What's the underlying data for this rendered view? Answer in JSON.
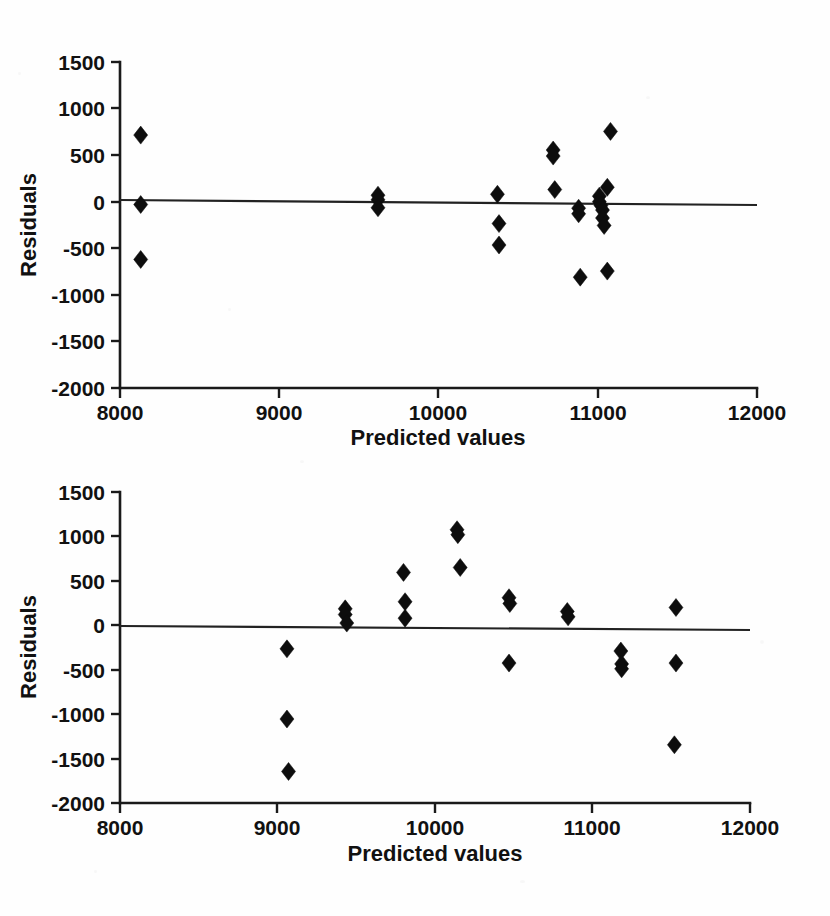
{
  "figure": {
    "background_color": "#fefefe",
    "ink_color": "#0d0d0d",
    "panel_count": 2
  },
  "panels": [
    {
      "id": "top",
      "name": "residual-plot-top",
      "ylabel": "Residuals",
      "xlabel": "Predicted values",
      "x_ticks": [
        "8000",
        "9000",
        "10000",
        "11000",
        "12000"
      ],
      "y_ticks": [
        "1500",
        "1000",
        "500",
        "0",
        "-500",
        "-1000",
        "-1500",
        "-2000"
      ]
    },
    {
      "id": "bottom",
      "name": "residual-plot-bottom",
      "ylabel": "Residuals",
      "xlabel": "Predicted values",
      "x_ticks": [
        "8000",
        "9000",
        "10000",
        "11000",
        "12000"
      ],
      "y_ticks": [
        "1500",
        "1000",
        "500",
        "0",
        "-500",
        "-1000",
        "-1500",
        "-2000"
      ]
    }
  ],
  "chart_data": [
    {
      "type": "scatter",
      "title": "",
      "subtitle": "",
      "xlabel": "Predicted values",
      "ylabel": "Residuals",
      "xlim": [
        8000,
        12000
      ],
      "ylim": [
        -2000,
        1500
      ],
      "xticks": [
        8000,
        9000,
        10000,
        11000,
        12000
      ],
      "yticks": [
        1500,
        1000,
        500,
        0,
        -500,
        -1000,
        -1500,
        -2000
      ],
      "grid": false,
      "legend": null,
      "reference_line": {
        "y": 0,
        "style": "solid"
      },
      "marker": "diamond",
      "series": [
        {
          "name": "residuals",
          "points": [
            [
              8130,
              715
            ],
            [
              8130,
              -30
            ],
            [
              8130,
              -620
            ],
            [
              9620,
              70
            ],
            [
              9620,
              20
            ],
            [
              9620,
              -65
            ],
            [
              10370,
              80
            ],
            [
              10380,
              -235
            ],
            [
              10380,
              -465
            ],
            [
              10720,
              555
            ],
            [
              10720,
              490
            ],
            [
              10730,
              130
            ],
            [
              10880,
              -70
            ],
            [
              10880,
              -130
            ],
            [
              10890,
              -810
            ],
            [
              11010,
              60
            ],
            [
              11010,
              0
            ],
            [
              11020,
              -40
            ],
            [
              11030,
              -90
            ],
            [
              11030,
              -175
            ],
            [
              11040,
              -255
            ],
            [
              11060,
              155
            ],
            [
              11060,
              -745
            ],
            [
              11080,
              755
            ]
          ]
        }
      ]
    },
    {
      "type": "scatter",
      "title": "",
      "subtitle": "",
      "xlabel": "Predicted values",
      "ylabel": "Residuals",
      "xlim": [
        8000,
        12000
      ],
      "ylim": [
        -2000,
        1500
      ],
      "xticks": [
        8000,
        9000,
        10000,
        11000,
        12000
      ],
      "yticks": [
        1500,
        1000,
        500,
        0,
        -500,
        -1000,
        -1500,
        -2000
      ],
      "grid": false,
      "legend": null,
      "reference_line": {
        "y": 0,
        "style": "solid"
      },
      "marker": "diamond",
      "series": [
        {
          "name": "residuals",
          "points": [
            [
              9060,
              -265
            ],
            [
              9060,
              -1055
            ],
            [
              9070,
              -1645
            ],
            [
              9430,
              185
            ],
            [
              9430,
              120
            ],
            [
              9440,
              25
            ],
            [
              9800,
              595
            ],
            [
              9810,
              265
            ],
            [
              9810,
              80
            ],
            [
              10140,
              1075
            ],
            [
              10145,
              1020
            ],
            [
              10160,
              650
            ],
            [
              10470,
              310
            ],
            [
              10475,
              245
            ],
            [
              10470,
              -425
            ],
            [
              10840,
              155
            ],
            [
              10845,
              95
            ],
            [
              11180,
              -290
            ],
            [
              11185,
              -435
            ],
            [
              11185,
              -490
            ],
            [
              11530,
              200
            ],
            [
              11530,
              -425
            ],
            [
              11520,
              -1345
            ]
          ]
        }
      ]
    }
  ]
}
